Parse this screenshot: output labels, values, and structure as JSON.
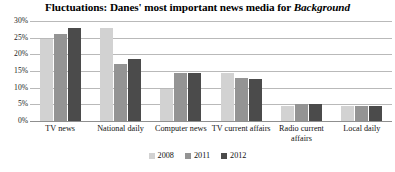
{
  "chart_data": {
    "type": "bar",
    "title": "Fluctuations: Danes' most important news media for Background",
    "title_plain": "Fluctuations: Danes' most important news media for ",
    "title_emphasis": "Background",
    "xlabel": "",
    "ylabel": "",
    "ylim": [
      0,
      30
    ],
    "grid": true,
    "legend_position": "bottom-center",
    "ytick_labels": [
      "30%",
      "25%",
      "20%",
      "15%",
      "10%",
      "5%",
      "0%"
    ],
    "ytick_values": [
      30,
      25,
      20,
      15,
      10,
      5,
      0
    ],
    "categories": [
      "TV news",
      "National daily",
      "Computer news",
      "TV current affairs",
      "Radio current affairs",
      "Local daily"
    ],
    "series": [
      {
        "name": "2008",
        "color": "#d2d2d2",
        "values": [
          24.5,
          28.0,
          9.5,
          14.5,
          4.5,
          4.5
        ]
      },
      {
        "name": "2011",
        "color": "#949494",
        "values": [
          26.0,
          17.0,
          14.5,
          13.0,
          5.0,
          4.5
        ]
      },
      {
        "name": "2012",
        "color": "#4b4b4b",
        "values": [
          28.0,
          18.5,
          14.5,
          12.5,
          5.0,
          4.5
        ]
      }
    ]
  }
}
